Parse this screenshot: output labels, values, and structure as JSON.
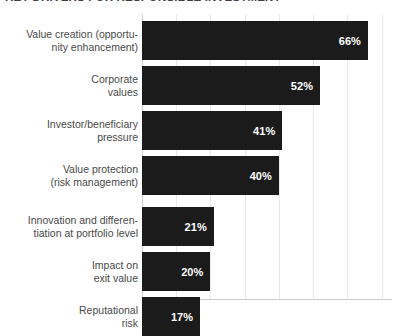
{
  "chart": {
    "title": "KEY DRIVERS FOR RESPONSIBLE INVESTMENT"
  },
  "chart_data": {
    "type": "bar",
    "orientation": "horizontal",
    "title": "KEY DRIVERS FOR RESPONSIBLE INVESTMENT",
    "xlabel": "",
    "ylabel": "",
    "xlim": [
      0,
      73
    ],
    "grid": true,
    "gridline_values": [
      0,
      10,
      20,
      30,
      40,
      50,
      60,
      70
    ],
    "legend": null,
    "tick_labels_visible": false,
    "value_label_suffix": "%",
    "bar_color": "#1b1b1b",
    "value_label_color": "#ffffff",
    "category_label_color": "#4a4a4a",
    "categories": [
      "Value creation (opportu-\nnity enhancement)",
      "Corporate\nvalues",
      "Investor/beneficiary\npressure",
      "Value protection\n(risk management)",
      "Innovation and differen-\ntiation at portfolio level",
      "Impact on\nexit value",
      "Reputational\nrisk"
    ],
    "values": [
      66,
      52,
      41,
      40,
      21,
      20,
      17
    ],
    "value_labels": [
      "66%",
      "52%",
      "41%",
      "40%",
      "21%",
      "20%",
      "17%"
    ]
  }
}
